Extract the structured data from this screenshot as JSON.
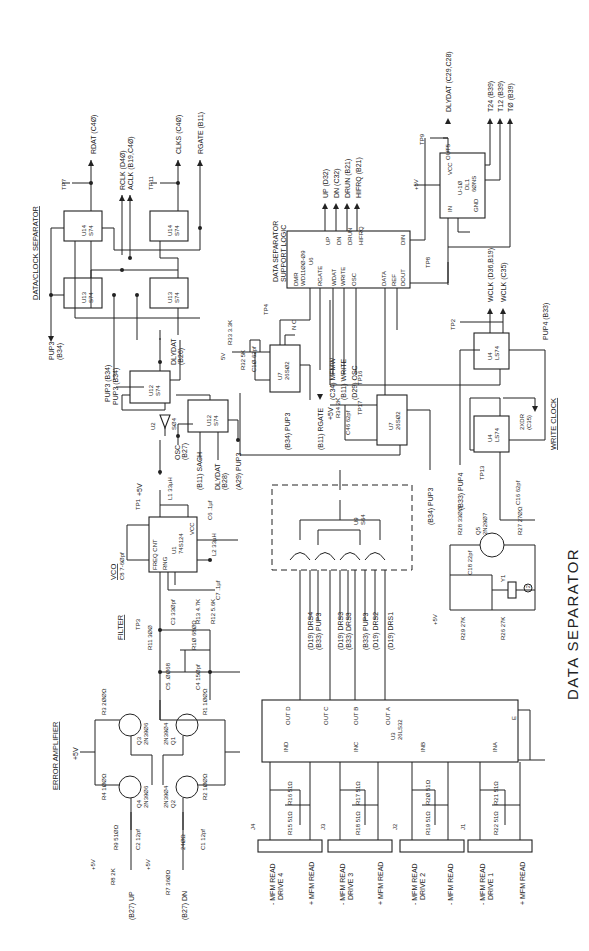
{
  "title": "DATA SEPARATOR",
  "sections": {
    "data_clock_separator": "DATA/CLOCK SEPARATOR",
    "error_amplifier": "ERROR AMPLIFIER",
    "filter": "FILTER",
    "vco": "VCO",
    "write_clock": "WRITE CLOCK",
    "support_logic_1": "DATA SEPARATOR",
    "support_logic_2": "SUPPORT LOGIC"
  },
  "outputs": {
    "rdat": "RDAT (C4Ø)",
    "rclk": "RCLK (D4Ø)",
    "aclk": "ACLK (B19,C4Ø)",
    "clks": "CLKS (C4Ø)",
    "rgate": "RGATE (B11)",
    "up": "UP (D32)",
    "dn": "DN (C32)",
    "drun": "DRUN (B21)",
    "hifrq": "HIFRQ (B21)",
    "dlydat": "DLYDAT (C29,C28)",
    "t24": "T24 (B39)",
    "t12": "T12 (B39)",
    "t0": "TØ (B39)",
    "wclk": "WCLK (D36,B19)",
    "wclk_n": "WCLK (C35)",
    "pup4_b33": "PUP4 (B33)",
    "pup3_b34_a": "PUP3 (B34)",
    "pup3_b34_b": "PUP3 (B34)",
    "pup3_b34_c": "PUP3",
    "pup3_b34_c2": "(B34)",
    "dlydat_b26": "DLYDAT",
    "dlydat_b26b": "(B26)",
    "osc_b27": "OSC",
    "osc_b27b": "(B27)",
    "b11_sach": "(B11) SACH",
    "dlydat_b28": "DLYDAT",
    "dlydat_b28b": "(B28)",
    "a29_pup3": "(A29) PUP3",
    "b11_rgate": "(B11) RGATE",
    "c34_mfmw": "(C34) MFMW",
    "b11_write": "(B11) WRITE",
    "d29_osc": "(D29) OSC",
    "b34_pup3_u7": "(B34) PUP3",
    "b34_pup3_u7b": "(B34) PUP3",
    "b33_pup4": "(B33) PUP4",
    "b34_pup3_main": "(B34) PUP3",
    "twoxdr": "2XDR",
    "twoxdr_b": "(C35)",
    "b27_up": "(B27) UP",
    "b27_dn": "(B27) DN",
    "drs4": "(D19) DRS4",
    "pup3_a": "(B33) PUP3",
    "drs3a": "(D19) DRS3",
    "drs3b": "(B33) DRS3",
    "pup3_b": "(B33) PUP3",
    "drs2": "(D19) DRS2",
    "drs1": "(D19) DRS1"
  },
  "test_points": [
    "TP7",
    "TP11",
    "TP9",
    "TP8",
    "TP1",
    "TP2",
    "TP3",
    "TP4",
    "TP6",
    "TP16",
    "TP17",
    "TP13"
  ],
  "power": {
    "p5v": "+5V",
    "v5": "5V",
    "nc": "N C"
  },
  "components": {
    "u14a": {
      "ref": "U14",
      "type": "S74",
      "pins": {
        "s": "S",
        "d": "D",
        "r": "R",
        "q": "Q"
      },
      "p_s": "1Ø",
      "p_d": "12",
      "p_clk": "11",
      "p_r": "13",
      "p_q": "8"
    },
    "u14b": {
      "ref": "U14",
      "type": "S74",
      "p_s": "4",
      "p_d": "2",
      "p_clk": "3",
      "p_r": "1",
      "p_q": "6"
    },
    "u13a": {
      "ref": "U13",
      "type": "S74",
      "p_s": "1Ø",
      "p_d": "12",
      "p_clk": "11",
      "p_r": "13",
      "p_q": "9"
    },
    "u13b": {
      "ref": "U13",
      "type": "S74",
      "p_s": "4",
      "p_d": "2",
      "p_clk": "3",
      "p_r": "1",
      "p_q": "5"
    },
    "u12a": {
      "ref": "U12",
      "type": "S74",
      "p_s": "4",
      "p_d": "2",
      "p_clk": "3",
      "p_r": "1",
      "p_q": "5",
      "p_qn": "6"
    },
    "u12b": {
      "ref": "U12",
      "type": "S74",
      "p_s": "1Ø",
      "p_d": "12",
      "p_clk": "11",
      "p_r": "13",
      "p_q": "9"
    },
    "u2": {
      "ref": "U2",
      "type": "SØ4",
      "p_in": "11",
      "p_out": "1Ø"
    },
    "u1": {
      "ref": "U1",
      "type": "74S124",
      "l1": "FREQ CNT",
      "l2": "RNG",
      "l3": "EN2",
      "l4": "Y",
      "l5": "VCC",
      "l6": "ØGND",
      "l7": "GND"
    },
    "u6": {
      "ref": "U6",
      "type": "WD11ØØ-Ø9",
      "pins": [
        "DMR",
        "RGATE",
        "WDAT",
        "WRITE",
        "OSC",
        "DATA",
        "REF",
        "DOUT",
        "DIN",
        "UP",
        "DN",
        "DRUN",
        "HIFRQ"
      ]
    },
    "u7a": {
      "ref": "U7",
      "type": "26SØ2",
      "pins": [
        "A",
        "B",
        "C",
        "Q"
      ]
    },
    "u7b": {
      "ref": "U7",
      "type": "26SØ2",
      "pins": [
        "A",
        "B",
        "Q"
      ]
    },
    "u9": {
      "ref": "U9",
      "type": "S64"
    },
    "u3": {
      "ref": "U3",
      "type": "26LS32",
      "outs": [
        "OUT D",
        "OUT C",
        "OUT B",
        "OUT A"
      ],
      "ins": [
        "IND",
        "INC",
        "INB",
        "INA"
      ],
      "e": "E",
      "en": "E"
    },
    "dl1": {
      "ref": "DL1",
      "type": "U-1Ø",
      "sub": "6ØNS",
      "pins": [
        "VCC",
        "OUT5",
        "IN",
        "GND",
        "T1",
        "T2"
      ]
    },
    "u4a": {
      "ref": "U4",
      "type": "LS74",
      "p_s": "1Ø",
      "p_d": "12",
      "p_clk": "11",
      "p_r": "13",
      "p_q": "9"
    },
    "u4b": {
      "ref": "U4",
      "type": "LS74",
      "p_s": "4",
      "p_d": "2",
      "p_clk": "3",
      "p_r": "1",
      "p_q": "6"
    },
    "q1": {
      "ref": "Q1",
      "type": "2N39Ø4"
    },
    "q2": {
      "ref": "Q2",
      "type": "2N39Ø4"
    },
    "q3": {
      "ref": "Q3",
      "type": "2N39Ø6"
    },
    "q4": {
      "ref": "Q4",
      "type": "2N39Ø6"
    },
    "q5": {
      "ref": "Q5",
      "type": "2N29Ø7"
    },
    "y1": {
      "ref": "Y1",
      "note": "2"
    }
  },
  "passives": {
    "r1": "R1 1ØØΩ",
    "r2": "R2 1ØØΩ",
    "r3": "R3 2ØØΩ",
    "r4": "R4 1ØØΩ",
    "r7": "R7 36ØΩ",
    "r8": "R8 2K",
    "r9": "R9 51ØΩ",
    "r9v": "24ØΩ",
    "r10": "R1Ø 68ØΩ",
    "r11": "R11 3ØØ",
    "r12": "R12 5.6K",
    "r13": "R13 4.7K",
    "r15": "R15 51Ω",
    "r16": "R16 51Ω",
    "r17": "R17 51Ω",
    "r18": "R18 51Ω",
    "r19": "R19 51Ω",
    "r20": "R2Ø 51Ω",
    "r21": "R21 51Ω",
    "r22": "R22 51Ω",
    "r26": "R26 27K",
    "r27": "R27 27ØΩ",
    "r28": "R28 33ØΩ",
    "r29": "R29 27K",
    "r32": "R32 5K",
    "r33": "R33 3.3K",
    "r34": "R34 2K",
    "c1": "C1 12pf",
    "c2": "C2 12pf",
    "c3": "C3 33Øpf",
    "c4": "C4 15Øpf",
    "c5": "C5 .ØØ68",
    "c6": "C6 .1µf",
    "c7": "C7 .1µf",
    "c8": "C8 7-6Øpf",
    "c10": "C1Ø 62pf",
    "c16": "C16 62pf",
    "c18": "C18 22pf",
    "c46": "C46 62pf",
    "l1": "L1 33µH",
    "l2": "L2 33µH"
  },
  "connectors": [
    {
      "ref": "J4",
      "label1": "- MFM READ",
      "label2": "DRIVE 4",
      "label3": "+ MFM READ",
      "pin_a": "18",
      "pin_b": "17"
    },
    {
      "ref": "J3",
      "label1": "- MFM READ",
      "label2": "DRIVE 3",
      "label3": "+ MFM READ",
      "pin_a": "18",
      "pin_b": "17"
    },
    {
      "ref": "J2",
      "label1": "- MFM READ",
      "label2": "DRIVE 2",
      "label3": "- MFM READ",
      "pin_a": "18",
      "pin_b": "17"
    },
    {
      "ref": "J1",
      "label1": "- MFM READ",
      "label2": "DRIVE 1",
      "label3": "+ MFM READ",
      "pin_a": "18",
      "pin_b": "17"
    }
  ]
}
